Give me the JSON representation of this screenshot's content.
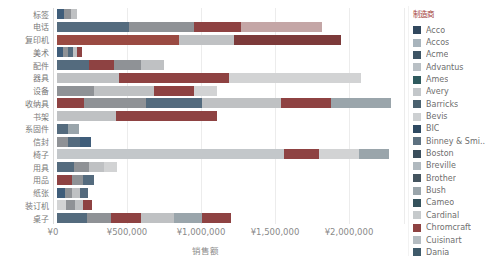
{
  "axis": {
    "x_title": "销售额",
    "currency": "¥"
  },
  "legend": {
    "title": "制造商",
    "items": [
      {
        "label": "Acco",
        "color": "#31485e"
      },
      {
        "label": "Accos",
        "color": "#a8b4bc"
      },
      {
        "label": "Acme",
        "color": "#3e5565"
      },
      {
        "label": "Advantus",
        "color": "#b9c0c5"
      },
      {
        "label": "Ames",
        "color": "#2f5a5e"
      },
      {
        "label": "Avery",
        "color": "#c3c7ca"
      },
      {
        "label": "Barricks",
        "color": "#4a616f"
      },
      {
        "label": "Bevis",
        "color": "#cdd0d2"
      },
      {
        "label": "BIC",
        "color": "#2e4a62"
      },
      {
        "label": "Binney & Smi..",
        "color": "#5d7180"
      },
      {
        "label": "Boston",
        "color": "#3a4e5c"
      },
      {
        "label": "Breville",
        "color": "#b0b9bf"
      },
      {
        "label": "Brother",
        "color": "#44545f"
      },
      {
        "label": "Bush",
        "color": "#9aa5ab"
      },
      {
        "label": "Cameo",
        "color": "#35525c"
      },
      {
        "label": "Cardinal",
        "color": "#c6cacc"
      },
      {
        "label": "Chromcraft",
        "color": "#8e4242"
      },
      {
        "label": "Cuisinart",
        "color": "#b4bcc1"
      },
      {
        "label": "Dania",
        "color": "#3f5a6a"
      }
    ]
  },
  "chart_data": {
    "type": "bar",
    "orientation": "horizontal-stacked",
    "xlabel": "销售额",
    "color_by": "制造商",
    "x_ticks": [
      {
        "label": "¥0",
        "value": 0
      },
      {
        "label": "¥500,000",
        "value": 500000
      },
      {
        "label": "¥1,000,000",
        "value": 1000000
      },
      {
        "label": "¥1,500,000",
        "value": 1500000
      },
      {
        "label": "¥2,000,000",
        "value": 2000000
      }
    ],
    "x_axis_display_max": 2380000,
    "categories": [
      "标签",
      "电话",
      "复印机",
      "美术",
      "配件",
      "器具",
      "设备",
      "收纳具",
      "书架",
      "系固件",
      "信封",
      "椅子",
      "用具",
      "用品",
      "纸张",
      "装订机",
      "桌子"
    ],
    "bars": [
      {
        "category": "标签",
        "total": 135000,
        "segments": [
          {
            "color": "#3f5d7a",
            "value": 47000
          },
          {
            "color": "#8f9296",
            "value": 47000
          },
          {
            "color": "#bfc1c3",
            "value": 41000
          }
        ]
      },
      {
        "category": "电话",
        "total": 1790000,
        "segments": [
          {
            "color": "#546b7e",
            "value": 487000
          },
          {
            "color": "#8f9296",
            "value": 439000
          },
          {
            "color": "#8e4242",
            "value": 318000
          },
          {
            "color": "#c4a6a6",
            "value": 546000
          }
        ]
      },
      {
        "category": "复印机",
        "total": 1919000,
        "segments": [
          {
            "color": "#9a4a42",
            "value": 824000
          },
          {
            "color": "#bfc1c3",
            "value": 372000
          },
          {
            "color": "#7c3a3a",
            "value": 723000
          }
        ]
      },
      {
        "category": "美术",
        "total": 169000,
        "segments": [
          {
            "color": "#3f5d7a",
            "value": 41000
          },
          {
            "color": "#8f9296",
            "value": 34000
          },
          {
            "color": "#546b7e",
            "value": 33000
          },
          {
            "color": "#bfc1c3",
            "value": 27000
          },
          {
            "color": "#8e4242",
            "value": 34000
          }
        ]
      },
      {
        "category": "配件",
        "total": 723000,
        "segments": [
          {
            "color": "#546b7e",
            "value": 216000
          },
          {
            "color": "#8e4242",
            "value": 169000
          },
          {
            "color": "#8f9296",
            "value": 183000
          },
          {
            "color": "#bfc1c3",
            "value": 155000
          }
        ]
      },
      {
        "category": "器具",
        "total": 2054000,
        "segments": [
          {
            "color": "#bfc1c3",
            "value": 419000
          },
          {
            "color": "#8e4242",
            "value": 743000
          },
          {
            "color": "#d2d3d4",
            "value": 892000
          }
        ]
      },
      {
        "category": "设备",
        "total": 1081000,
        "segments": [
          {
            "color": "#8f9296",
            "value": 250000
          },
          {
            "color": "#bfc1c3",
            "value": 405000
          },
          {
            "color": "#8e4242",
            "value": 271000
          },
          {
            "color": "#d2d3d4",
            "value": 155000
          }
        ]
      },
      {
        "category": "收纳具",
        "total": 2257000,
        "segments": [
          {
            "color": "#8e4242",
            "value": 182000
          },
          {
            "color": "#8f9296",
            "value": 419000
          },
          {
            "color": "#546b7e",
            "value": 378000
          },
          {
            "color": "#bfc1c3",
            "value": 534000
          },
          {
            "color": "#8e4242",
            "value": 338000
          },
          {
            "color": "#9aa5ab",
            "value": 406000
          }
        ]
      },
      {
        "category": "书架",
        "total": 1081000,
        "segments": [
          {
            "color": "#bfc1c3",
            "value": 399000
          },
          {
            "color": "#8e4242",
            "value": 682000
          }
        ]
      },
      {
        "category": "系固件",
        "total": 149000,
        "segments": [
          {
            "color": "#546b7e",
            "value": 75000
          },
          {
            "color": "#9aa5ab",
            "value": 74000
          }
        ]
      },
      {
        "category": "信封",
        "total": 230000,
        "segments": [
          {
            "color": "#8f9296",
            "value": 75000
          },
          {
            "color": "#546b7e",
            "value": 81000
          },
          {
            "color": "#3f5d7a",
            "value": 74000
          }
        ]
      },
      {
        "category": "椅子",
        "total": 2243000,
        "segments": [
          {
            "color": "#c3c7ca",
            "value": 1534000
          },
          {
            "color": "#8e4242",
            "value": 236000
          },
          {
            "color": "#d2d3d4",
            "value": 270000
          },
          {
            "color": "#9aa5ab",
            "value": 203000
          }
        ]
      },
      {
        "category": "用具",
        "total": 405000,
        "segments": [
          {
            "color": "#546b7e",
            "value": 115000
          },
          {
            "color": "#8f9296",
            "value": 101000
          },
          {
            "color": "#bfc1c3",
            "value": 101000
          },
          {
            "color": "#d2d3d4",
            "value": 88000
          }
        ]
      },
      {
        "category": "用品",
        "total": 250000,
        "segments": [
          {
            "color": "#8e4242",
            "value": 101000
          },
          {
            "color": "#8f9296",
            "value": 75000
          },
          {
            "color": "#546b7e",
            "value": 74000
          }
        ]
      },
      {
        "category": "纸张",
        "total": 209000,
        "segments": [
          {
            "color": "#3f5d7a",
            "value": 54000
          },
          {
            "color": "#8f9296",
            "value": 47000
          },
          {
            "color": "#bfc1c3",
            "value": 54000
          },
          {
            "color": "#546b7e",
            "value": 54000
          }
        ]
      },
      {
        "category": "装订机",
        "total": 236000,
        "segments": [
          {
            "color": "#d2d3d4",
            "value": 61000
          },
          {
            "color": "#8f9296",
            "value": 61000
          },
          {
            "color": "#bfc1c3",
            "value": 53000
          },
          {
            "color": "#8e4242",
            "value": 61000
          }
        ]
      },
      {
        "category": "桌子",
        "total": 1176000,
        "segments": [
          {
            "color": "#546b7e",
            "value": 203000
          },
          {
            "color": "#8f9296",
            "value": 162000
          },
          {
            "color": "#8e4242",
            "value": 203000
          },
          {
            "color": "#bfc1c3",
            "value": 223000
          },
          {
            "color": "#9aa5ab",
            "value": 189000
          },
          {
            "color": "#8e4242",
            "value": 196000
          }
        ]
      }
    ]
  }
}
